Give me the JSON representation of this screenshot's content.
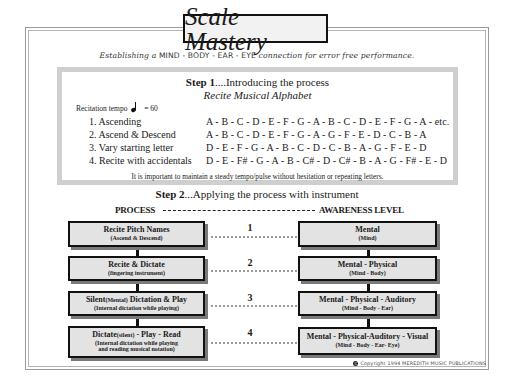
{
  "title": "Scale Mastery",
  "subtitle": {
    "pre": "Establishing a ",
    "caps": "MIND - BODY - EAR - EYE",
    "post": " connection for error free performance."
  },
  "step1": {
    "label": "Step 1",
    "heading": "....Introducing the process",
    "subheading": "Recite Musical Alphabet",
    "tempo_label": "Recitation tempo",
    "tempo_note_icon": "quarter-note",
    "tempo_value": "= 60",
    "rows": [
      {
        "label": "1. Ascending",
        "sequence": "A - B - C - D - E - F - G - A - B - C - D - E - F - G - A - etc."
      },
      {
        "label": "2. Ascend & Descend",
        "sequence": "A - B - C - D - E - F - G - A - G - F - E - D - C - B - A"
      },
      {
        "label": "3. Vary starting letter",
        "sequence": "D - E - F - G - A - B - C - D - C - B - A - G - F - E - D"
      },
      {
        "label": "4. Recite with accidentals",
        "sequence": "D - E - F# - G - A - B - C# - D - C# - B - A - G - F# - E - D"
      }
    ],
    "note": "It is important to maintain a steady tempo/pulse without hesitation or repeating letters."
  },
  "step2": {
    "label": "Step 2",
    "heading": "...Applying the process with instrument",
    "col_left": "PROCESS",
    "col_right": "AWARENESS LEVEL",
    "process": [
      {
        "title": "Recite Pitch Names",
        "title_small": "",
        "title_after": "",
        "sub": "(Ascend & Descend)",
        "sub2": ""
      },
      {
        "title": "Recite & Dictate",
        "title_small": "",
        "title_after": "",
        "sub": "(fingering instrument)",
        "sub2": ""
      },
      {
        "title": "Silent",
        "title_small": "(Mental)",
        "title_after": " Dictation & Play",
        "sub": "(Internal dictation while playing)",
        "sub2": ""
      },
      {
        "title": "Dictate",
        "title_small": "(silent)",
        "title_after": " - Play - Read",
        "sub": "(Internal dictation while playing",
        "sub2": "and reading musical notation)"
      }
    ],
    "numbers": [
      "1",
      "2",
      "3",
      "4"
    ],
    "awareness": [
      {
        "title": "Mental",
        "sub": "(Mind)"
      },
      {
        "title": "Mental - Physical",
        "sub": "(Mind - Body)"
      },
      {
        "title": "Mental - Physical - Auditory",
        "sub": "(Mind - Body - Ear)"
      },
      {
        "title": "Mental - Physical-Auditory - Visual",
        "sub": "(Mind - Body - Ear- Eye)"
      }
    ]
  },
  "copyright": {
    "icon": "copyright-icon",
    "symbol": "C",
    "text": "Copyright 1994 MEREDITH MUSIC PUBLICATIONS"
  }
}
